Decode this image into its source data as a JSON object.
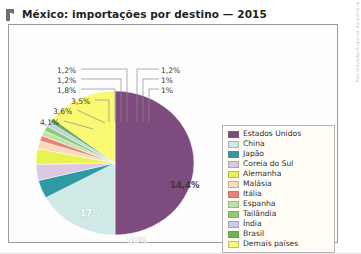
{
  "header": {
    "title": "México: importações por destino — 2015",
    "icon": "flag-marker-icon"
  },
  "credit": {
    "text": "Reprodução/Arquivo da editora"
  },
  "chart_data": {
    "type": "pie",
    "title": "México: importações por destino — 2015",
    "unit": "%",
    "legend_position": "right",
    "grid": false,
    "categories": [
      "Estados Unidos",
      "China",
      "Japão",
      "Coreia do Sul",
      "Alemanha",
      "Malásia",
      "Itália",
      "Espanha",
      "Tailândia",
      "Índia",
      "Brasil",
      "Demais países"
    ],
    "values": [
      50,
      17,
      4.1,
      3.6,
      3.5,
      1.8,
      1.2,
      1.2,
      1.2,
      1,
      1,
      14.4
    ],
    "value_labels": [
      "50%",
      "17%",
      "4,1%",
      "3,6%",
      "3,5%",
      "1,8%",
      "1,2%",
      "1,2%",
      "1,2%",
      "1%",
      "1%",
      "14,4%"
    ],
    "colors": [
      "#7d4b7d",
      "#cfe9e6",
      "#2f9aa3",
      "#ddc8e0",
      "#eaf252",
      "#fbd9bb",
      "#ec8077",
      "#bde3a8",
      "#8fcc7a",
      "#c6cdea",
      "#6ab84a",
      "#fbf871"
    ]
  },
  "pie_labels": {
    "inner": [
      {
        "text": "50%",
        "for": "Estados Unidos"
      },
      {
        "text": "17%",
        "for": "China"
      },
      {
        "text": "14,4%",
        "for": "Demais países"
      }
    ],
    "callouts_left": [
      "1,2%",
      "1,2%",
      "1,8%",
      "3,5%",
      "3,6%",
      "4,1%"
    ],
    "callouts_right": [
      "1,2%",
      "1%",
      "1%"
    ]
  },
  "legend": {
    "items": [
      {
        "label": "Estados Unidos",
        "color": "#7d4b7d"
      },
      {
        "label": "China",
        "color": "#cfe9e6"
      },
      {
        "label": "Japão",
        "color": "#2f9aa3"
      },
      {
        "label": "Coreia do Sul",
        "color": "#ddc8e0"
      },
      {
        "label": "Alemanha",
        "color": "#eaf252"
      },
      {
        "label": "Malásia",
        "color": "#fbd9bb"
      },
      {
        "label": "Itália",
        "color": "#ec8077"
      },
      {
        "label": "Espanha",
        "color": "#bde3a8"
      },
      {
        "label": "Tailândia",
        "color": "#8fcc7a"
      },
      {
        "label": "Índia",
        "color": "#c6cdea"
      },
      {
        "label": "Brasil",
        "color": "#6ab84a"
      },
      {
        "label": "Demais países",
        "color": "#fbf871"
      }
    ]
  }
}
